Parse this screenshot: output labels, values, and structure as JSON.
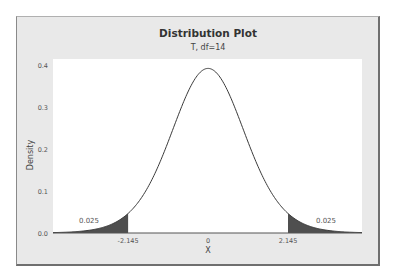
{
  "chart_data": {
    "type": "area",
    "title": "Distribution Plot",
    "subtitle": "T, df=14",
    "distribution": "t",
    "df": 14,
    "xlabel": "X",
    "ylabel": "Density",
    "xlim": [
      -4.16,
      4.13
    ],
    "ylim": [
      0.0,
      0.4
    ],
    "yticks": [
      "0.0",
      "0.1",
      "0.2",
      "0.3",
      "0.4"
    ],
    "ytick_values": [
      0.0,
      0.1,
      0.2,
      0.3,
      0.4
    ],
    "xticks": [
      "-2.145",
      "0",
      "2.145"
    ],
    "xtick_values": [
      -2.145,
      0,
      2.145
    ],
    "peak_density": 0.3925,
    "shaded_regions": [
      {
        "from": -4.16,
        "to": -2.145,
        "area": 0.025,
        "label": "0.025"
      },
      {
        "from": 2.145,
        "to": 4.13,
        "area": 0.025,
        "label": "0.025"
      }
    ],
    "critical_values": [
      -2.145,
      2.145
    ],
    "grid": false,
    "legend": "none"
  },
  "colors": {
    "frame_bg": "#e9e9e9",
    "plot_bg": "#ffffff",
    "curve": "#3a3a3a",
    "shade": "#4f4f4f",
    "text": "#444444"
  }
}
